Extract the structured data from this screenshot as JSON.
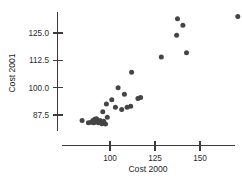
{
  "chart_data": {
    "type": "scatter",
    "title": "",
    "xlabel": "Cost 2000",
    "ylabel": "Cost 2001",
    "xlim": [
      82,
      178
    ],
    "ylim": [
      81.5,
      134
    ],
    "xticks": [
      100,
      125,
      150
    ],
    "xtick_labels": [
      "100",
      "125",
      "150"
    ],
    "yticks": [
      87.5,
      100.0,
      112.5,
      125.0
    ],
    "ytick_labels": [
      "87.5",
      "100.0",
      "112.5",
      "125.0"
    ],
    "grid": false,
    "legend": null,
    "marker": "filled-circle",
    "marker_color": "#454545",
    "points": [
      {
        "x": 84.5,
        "y": 85.0
      },
      {
        "x": 88.0,
        "y": 84.0
      },
      {
        "x": 89.5,
        "y": 84.2
      },
      {
        "x": 90.5,
        "y": 85.0
      },
      {
        "x": 91.0,
        "y": 84.0
      },
      {
        "x": 91.5,
        "y": 85.5
      },
      {
        "x": 92.0,
        "y": 84.5
      },
      {
        "x": 92.5,
        "y": 85.8
      },
      {
        "x": 93.5,
        "y": 84.0
      },
      {
        "x": 94.5,
        "y": 85.0
      },
      {
        "x": 95.5,
        "y": 83.5
      },
      {
        "x": 96.5,
        "y": 84.6
      },
      {
        "x": 97.5,
        "y": 83.4
      },
      {
        "x": 98.5,
        "y": 86.5
      },
      {
        "x": 96.0,
        "y": 89.0
      },
      {
        "x": 98.0,
        "y": 92.5
      },
      {
        "x": 101.0,
        "y": 94.5
      },
      {
        "x": 103.0,
        "y": 91.0
      },
      {
        "x": 104.5,
        "y": 100.0
      },
      {
        "x": 106.5,
        "y": 90.0
      },
      {
        "x": 108.0,
        "y": 97.0
      },
      {
        "x": 109.5,
        "y": 91.0
      },
      {
        "x": 111.5,
        "y": 91.5
      },
      {
        "x": 112.0,
        "y": 107.0
      },
      {
        "x": 115.5,
        "y": 95.0
      },
      {
        "x": 117.0,
        "y": 95.5
      },
      {
        "x": 128.5,
        "y": 114.0
      },
      {
        "x": 137.5,
        "y": 131.5
      },
      {
        "x": 137.0,
        "y": 124.0
      },
      {
        "x": 140.5,
        "y": 128.5
      },
      {
        "x": 142.5,
        "y": 116.0
      },
      {
        "x": 171.0,
        "y": 132.5
      }
    ]
  },
  "axes": {
    "x_axis_name": "Cost 2000",
    "y_axis_name": "Cost 2001"
  }
}
